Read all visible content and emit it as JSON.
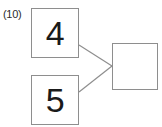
{
  "figure": {
    "label": "(10)",
    "stroke_color": "#8e8e8e",
    "text_color": "#1a1a1a",
    "background_color": "#ffffff"
  },
  "nodes": [
    {
      "id": "input-a",
      "value": "4",
      "role": "input"
    },
    {
      "id": "input-b",
      "value": "5",
      "role": "input"
    },
    {
      "id": "output",
      "value": "",
      "role": "output"
    }
  ],
  "edges": [
    {
      "from": "input-a",
      "to": "output"
    },
    {
      "from": "input-b",
      "to": "output"
    }
  ]
}
